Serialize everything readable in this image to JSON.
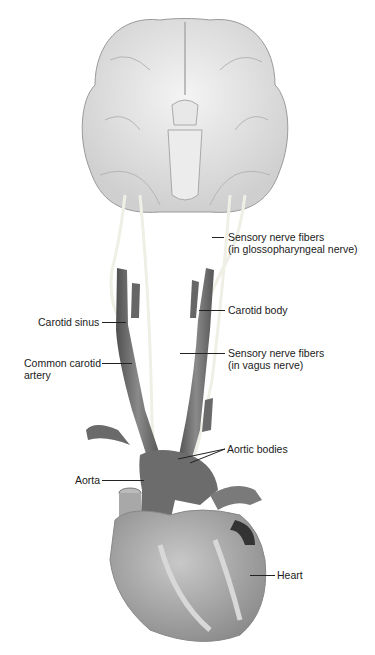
{
  "figure": {
    "colors": {
      "background": "#ffffff",
      "brain": "#e4e4e4",
      "vessel": "#6e6e6e",
      "heart": "#a6a6a6",
      "nerve": "#f2f2ea",
      "leader_line": "#222222",
      "text": "#1a1a1a"
    }
  },
  "labels": {
    "sensory_glosso_line1": "Sensory nerve fibers",
    "sensory_glosso_line2": "(in glossopharyngeal nerve)",
    "carotid_body": "Carotid body",
    "carotid_sinus": "Carotid sinus",
    "common_carotid_line1": "Common carotid",
    "common_carotid_line2": "artery",
    "sensory_vagus_line1": "Sensory nerve fibers",
    "sensory_vagus_line2": "(in vagus nerve)",
    "aortic_bodies": "Aortic bodies",
    "aorta": "Aorta",
    "heart": "Heart"
  }
}
